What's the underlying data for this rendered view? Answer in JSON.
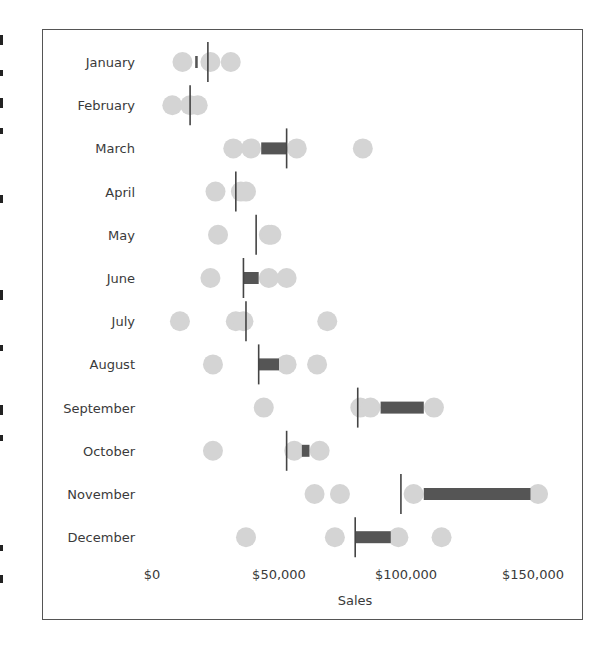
{
  "chart_data": {
    "type": "dot-range",
    "title": "",
    "xlabel": "Sales",
    "ylabel": "",
    "xlim": [
      0,
      150000
    ],
    "x_ticks": [
      0,
      50000,
      100000,
      150000
    ],
    "x_tick_labels": [
      "$0",
      "$50,000",
      "$100,000",
      "$150,000"
    ],
    "grid": false,
    "legend": null,
    "categories": [
      "January",
      "February",
      "March",
      "April",
      "May",
      "June",
      "July",
      "August",
      "September",
      "October",
      "November",
      "December"
    ],
    "series": [
      {
        "name": "individual sales (dots)",
        "values": [
          [
            12000,
            23000,
            31000
          ],
          [
            8000,
            15000,
            18000
          ],
          [
            32000,
            39000,
            57000,
            83000
          ],
          [
            25000,
            35000,
            37000
          ],
          [
            26000,
            46000,
            47000
          ],
          [
            23000,
            46000,
            53000
          ],
          [
            11000,
            33000,
            36000,
            69000
          ],
          [
            24000,
            53000,
            65000
          ],
          [
            44000,
            82000,
            86000,
            111000
          ],
          [
            24000,
            56000,
            66000
          ],
          [
            64000,
            74000,
            103000,
            152000
          ],
          [
            37000,
            72000,
            97000,
            114000
          ]
        ]
      },
      {
        "name": "target (vertical line)",
        "values": [
          22000,
          15000,
          53000,
          33000,
          41000,
          36000,
          37000,
          42000,
          81000,
          53000,
          98000,
          80000
        ]
      },
      {
        "name": "range bar",
        "values": [
          [
            17000,
            18000
          ],
          null,
          [
            43000,
            53000
          ],
          null,
          null,
          [
            36000,
            42000
          ],
          null,
          [
            42000,
            50000
          ],
          [
            90000,
            107000
          ],
          [
            59000,
            62000
          ],
          [
            107000,
            149000
          ],
          [
            80000,
            94000
          ]
        ]
      }
    ],
    "colors": {
      "dot": "#d4d4d4",
      "bar": "#555555",
      "target_line": "#444444",
      "frame": "#555555"
    }
  }
}
